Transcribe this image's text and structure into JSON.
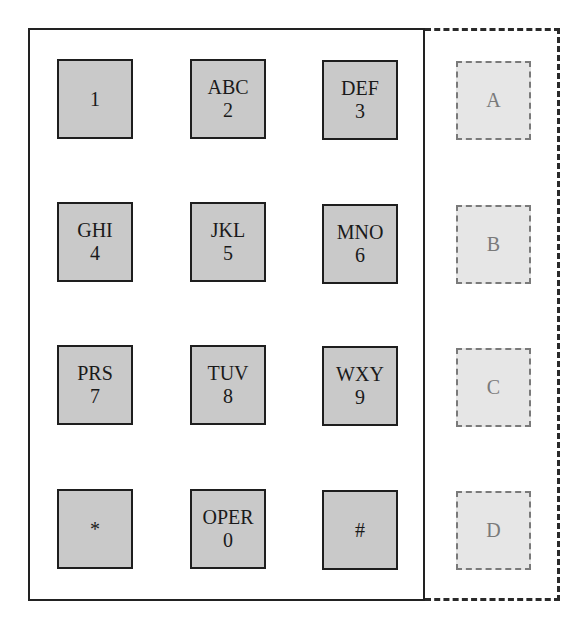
{
  "keypad": {
    "title": "Telephone keypad with extended DTMF keys",
    "keys": [
      {
        "letters": "",
        "digit": "1"
      },
      {
        "letters": "ABC",
        "digit": "2"
      },
      {
        "letters": "DEF",
        "digit": "3"
      },
      {
        "letters": "GHI",
        "digit": "4"
      },
      {
        "letters": "JKL",
        "digit": "5"
      },
      {
        "letters": "MNO",
        "digit": "6"
      },
      {
        "letters": "PRS",
        "digit": "7"
      },
      {
        "letters": "TUV",
        "digit": "8"
      },
      {
        "letters": "WXY",
        "digit": "9"
      },
      {
        "letters": "",
        "digit": "*"
      },
      {
        "letters": "OPER",
        "digit": "0"
      },
      {
        "letters": "",
        "digit": "#"
      }
    ]
  },
  "aux_keys": {
    "keys": [
      {
        "label": "A"
      },
      {
        "label": "B"
      },
      {
        "label": "C"
      },
      {
        "label": "D"
      }
    ]
  },
  "colors": {
    "key_fill": "#c9c9c9",
    "key_border": "#1e1e1e",
    "aux_fill": "#e6e6e6",
    "aux_border": "#7a7a7a",
    "frame": "#222222"
  }
}
